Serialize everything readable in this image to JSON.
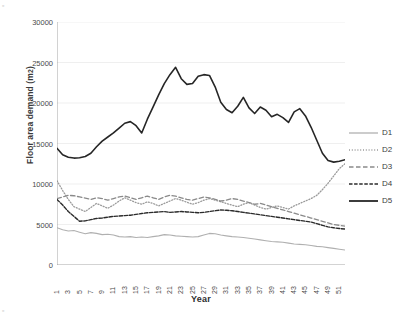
{
  "chart_data": {
    "type": "line",
    "title": "",
    "xlabel": "Year",
    "ylabel": "Floor area demand (m2)",
    "ylim": [
      0,
      30000
    ],
    "ytick_values": [
      0,
      5000,
      10000,
      15000,
      20000,
      25000,
      30000
    ],
    "ytick_labels": [
      "0",
      "5000",
      "10000",
      "15000",
      "20000",
      "25000",
      "30000"
    ],
    "grid": true,
    "grid_axis": "y",
    "legend_position": "right",
    "x": [
      1,
      2,
      3,
      4,
      5,
      6,
      7,
      8,
      9,
      10,
      11,
      12,
      13,
      14,
      15,
      16,
      17,
      18,
      19,
      20,
      21,
      22,
      23,
      24,
      25,
      26,
      27,
      28,
      29,
      30,
      31,
      32,
      33,
      34,
      35,
      36,
      37,
      38,
      39,
      40,
      41,
      42,
      43,
      44,
      45,
      46,
      47,
      48,
      49,
      50,
      51,
      52
    ],
    "xtick_labels": [
      "1",
      "3",
      "5",
      "7",
      "9",
      "11",
      "13",
      "15",
      "17",
      "19",
      "21",
      "23",
      "25",
      "27",
      "29",
      "31",
      "33",
      "35",
      "37",
      "39",
      "41",
      "43",
      "45",
      "47",
      "49",
      "51"
    ],
    "series": [
      {
        "name": "D1",
        "style": "solid-light",
        "color": "#b0b0b0",
        "width": 1.1,
        "values": [
          4600,
          4350,
          4200,
          4250,
          4050,
          3850,
          4000,
          3900,
          3750,
          3800,
          3700,
          3500,
          3450,
          3500,
          3400,
          3450,
          3400,
          3500,
          3600,
          3750,
          3700,
          3600,
          3550,
          3500,
          3450,
          3500,
          3700,
          3900,
          3850,
          3700,
          3600,
          3500,
          3450,
          3400,
          3300,
          3200,
          3100,
          3000,
          2900,
          2850,
          2800,
          2700,
          2600,
          2550,
          2500,
          2400,
          2300,
          2250,
          2150,
          2050,
          1950,
          1850
        ]
      },
      {
        "name": "D2",
        "style": "dotted",
        "color": "#9a9a9a",
        "width": 1.3,
        "values": [
          10400,
          9200,
          8100,
          7200,
          6900,
          6600,
          7100,
          7600,
          7300,
          7000,
          7400,
          7900,
          8300,
          8000,
          7700,
          7500,
          7800,
          7600,
          7300,
          7600,
          7900,
          8200,
          8000,
          7750,
          7500,
          7700,
          8000,
          8200,
          8000,
          7800,
          7600,
          7400,
          7200,
          7500,
          7700,
          7400,
          7100,
          6900,
          7100,
          7300,
          7100,
          6900,
          7300,
          7600,
          7900,
          8200,
          8600,
          9300,
          10100,
          11000,
          11900,
          12500
        ]
      },
      {
        "name": "D3",
        "style": "dashed-long",
        "color": "#8a8a8a",
        "width": 1.3,
        "values": [
          8200,
          8400,
          8600,
          8550,
          8400,
          8250,
          8100,
          8300,
          8200,
          8000,
          8200,
          8400,
          8500,
          8300,
          8100,
          8300,
          8500,
          8300,
          8100,
          8400,
          8600,
          8500,
          8300,
          8100,
          8000,
          8200,
          8400,
          8300,
          8100,
          7900,
          8000,
          8200,
          8100,
          7900,
          7700,
          7500,
          7600,
          7400,
          7200,
          7000,
          6800,
          6600,
          6400,
          6200,
          6000,
          5800,
          5600,
          5400,
          5200,
          5000,
          4900,
          4800
        ]
      },
      {
        "name": "D4",
        "style": "dash-dot",
        "color": "#2b2b2b",
        "width": 1.4,
        "values": [
          8100,
          7400,
          6600,
          6000,
          5400,
          5450,
          5600,
          5750,
          5800,
          5900,
          6000,
          6050,
          6100,
          6150,
          6250,
          6350,
          6450,
          6500,
          6550,
          6600,
          6500,
          6550,
          6600,
          6550,
          6500,
          6450,
          6500,
          6600,
          6700,
          6800,
          6750,
          6700,
          6600,
          6500,
          6400,
          6300,
          6200,
          6100,
          6000,
          5900,
          5800,
          5700,
          5600,
          5500,
          5400,
          5300,
          5100,
          4900,
          4700,
          4600,
          4500,
          4450
        ]
      },
      {
        "name": "D5",
        "style": "solid-bold",
        "color": "#262626",
        "width": 1.6,
        "values": [
          14400,
          13600,
          13300,
          13200,
          13250,
          13400,
          13800,
          14600,
          15300,
          15800,
          16300,
          16900,
          17500,
          17700,
          17200,
          16300,
          18000,
          19500,
          21000,
          22400,
          23500,
          24400,
          23000,
          22300,
          22400,
          23300,
          23500,
          23400,
          22000,
          20100,
          19200,
          18800,
          19600,
          20700,
          19400,
          18700,
          19500,
          19100,
          18300,
          18600,
          18200,
          17600,
          18900,
          19300,
          18400,
          17000,
          15400,
          13800,
          12900,
          12700,
          12800,
          13000
        ]
      }
    ]
  },
  "legend": {
    "items": [
      {
        "label": "D1"
      },
      {
        "label": "D2"
      },
      {
        "label": "D3"
      },
      {
        "label": "D4"
      },
      {
        "label": "D5"
      }
    ]
  },
  "axis_titles": {
    "y_main": "Floor area demand (m",
    "y_sup": "2",
    "y_tail": ")",
    "x": "Year"
  }
}
